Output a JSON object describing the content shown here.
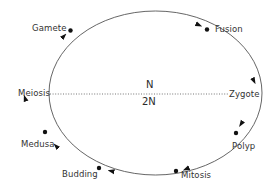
{
  "diagram": {
    "type": "life-cycle",
    "stages": [
      {
        "id": "gamete",
        "label": "Gamete"
      },
      {
        "id": "fusion",
        "label": "Fusion"
      },
      {
        "id": "zygote",
        "label": "Zygote"
      },
      {
        "id": "polyp",
        "label": "Polyp"
      },
      {
        "id": "mitosis",
        "label": "Mitosis"
      },
      {
        "id": "budding",
        "label": "Budding"
      },
      {
        "id": "medusa",
        "label": "Medusa"
      },
      {
        "id": "meiosis",
        "label": "Meiosis"
      }
    ],
    "ploidy": {
      "haploid_label": "N",
      "diploid_label": "2N"
    },
    "direction": "clockwise",
    "colors": {
      "line": "#555555",
      "dot": "#111111",
      "text": "#333333",
      "divider": "#666666"
    }
  }
}
